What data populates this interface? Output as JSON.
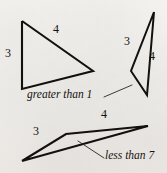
{
  "figure": {
    "background_color": "#f2f0ed",
    "ink_color": "#13100d",
    "width": 167,
    "height": 173
  },
  "shapes": {
    "tall_triangle": {
      "name": "open triangle upper left",
      "points": "22,21 22,89 93,71 22,21",
      "stroke_width": "2.1"
    },
    "thin_triangle": {
      "name": "narrow sliver triangle upper right",
      "points": "154,12 131,71 147,95 154,12",
      "stroke_width": "2.0"
    },
    "flat_shape": {
      "name": "flattened quadrilateral lower",
      "points": "22,161 66,134 148,126 22,161",
      "stroke_width": "2.1"
    }
  },
  "leaders": {
    "greater_than_leader": {
      "name": "leader line to sliver triangle",
      "path": "M 104,97 L 132,85"
    },
    "less_than_leader": {
      "name": "leader line to flat shape",
      "path": "M 78,141 L 104,158"
    }
  },
  "labels": {
    "tall_triangle_side_a": {
      "text": "3",
      "x": 5,
      "y": 47
    },
    "tall_triangle_side_b": {
      "text": "4",
      "x": 53,
      "y": 23
    },
    "thin_triangle_side_a": {
      "text": "3",
      "x": 124,
      "y": 35
    },
    "thin_triangle_side_b": {
      "text": "4",
      "x": 149,
      "y": 50
    },
    "flat_shape_side_a": {
      "text": "3",
      "x": 33,
      "y": 125
    },
    "flat_shape_side_b": {
      "text": "4",
      "x": 101,
      "y": 108
    }
  },
  "captions": {
    "greater_than": {
      "text": "greater than 1",
      "x": 27,
      "y": 89
    },
    "less_than": {
      "text": "less than 7",
      "x": 105,
      "y": 150
    }
  }
}
